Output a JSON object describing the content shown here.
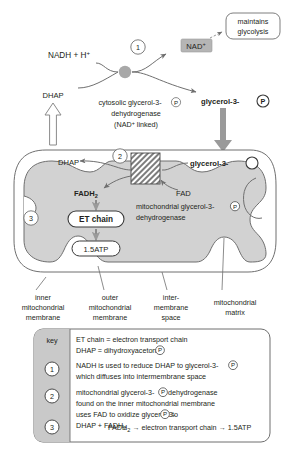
{
  "diagram": {
    "colors": {
      "outline": "#6f6f6f",
      "text": "#231f20",
      "matrix_fill": "#d2d2d2",
      "intermembrane_fill": "#ffffff",
      "nad_box_fill": "#b5b5b5",
      "arrow_grey": "#9a9a9a",
      "enzyme_hatch": "#8c8c8c",
      "key_panel_fill": "#c9c9c9",
      "circle_node": "#a8a8a8"
    },
    "cytosol": {
      "nadh_label": "NADH + H",
      "nadh_superscript": "+",
      "step_marker": "1",
      "nad_label": "NAD",
      "nad_superscript": "+",
      "maintains_line1": "maintains",
      "maintains_line2": "glycolysis",
      "dhap_label": "DHAP",
      "glycerol3p_label": "glycerol-3-",
      "phosphate_symbol": "P",
      "enzyme_line1": "cytosolic glycerol-3-",
      "enzyme_line1_suffix": "",
      "enzyme_line2": "dehydrogenase",
      "enzyme_line3": "(NAD",
      "enzyme_line3_suffix": " linked)"
    },
    "mitochondrion": {
      "step_marker": "2",
      "step_marker_et": "3",
      "dhap_label": "DHAP",
      "glycerol3p_label": "glycerol-3-",
      "fadh2_label": "FADH",
      "fadh2_subscript": "2",
      "fad_label": "FAD",
      "enzyme_line1": "mitochondrial glycerol-3-",
      "enzyme_line2": "dehydrogenase",
      "et_chain_label": "ET chain",
      "atp_label": "1.5ATP"
    },
    "structure_labels": [
      {
        "name": "inner-mitochondrial-membrane",
        "lines": [
          "inner",
          "mitochondrial",
          "membrane"
        ]
      },
      {
        "name": "outer-mitochondrial-membrane",
        "lines": [
          "outer",
          "mitochondrial",
          "membrane"
        ]
      },
      {
        "name": "intermembrane-space",
        "lines": [
          "inter-",
          "membrane",
          "space"
        ]
      },
      {
        "name": "mitochondrial-matrix",
        "lines": [
          "mitochondrial",
          "matrix"
        ]
      }
    ],
    "key": {
      "title": "key",
      "definitions": [
        "ET chain = electron transport chain",
        "DHAP = dihydroxyacetone-"
      ],
      "entries": [
        {
          "marker": "1",
          "lines": [
            "NADH is used to reduce DHAP to glycerol-3-",
            "which diffuses into intermembrane space"
          ]
        },
        {
          "marker": "2",
          "lines": [
            "mitochondrial glycerol-3-",
            "found on the inner mitochondrial membrane",
            "uses FAD to oxidize glycerol-3-",
            "DHAP + FADH"
          ]
        },
        {
          "marker": "3",
          "lines": [
            "FADH",
            " → electron transport chain → 1.5ATP"
          ]
        }
      ]
    }
  }
}
